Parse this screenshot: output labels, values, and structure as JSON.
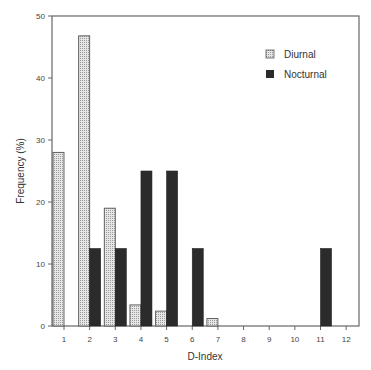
{
  "chart_data": {
    "type": "bar",
    "title": "",
    "xlabel": "D-Index",
    "ylabel": "Frequency (%)",
    "ylim": [
      0,
      50
    ],
    "yticks": [
      0,
      10,
      20,
      30,
      40,
      50
    ],
    "categories": [
      "1",
      "2",
      "3",
      "4",
      "5",
      "6",
      "7",
      "8",
      "9",
      "10",
      "11",
      "12"
    ],
    "series": [
      {
        "name": "Diurnal",
        "values": [
          28,
          46.8,
          19,
          3.4,
          2.4,
          0,
          1.2,
          0,
          0,
          0,
          0,
          0
        ],
        "color": "#d9d9d9",
        "pattern": "dotted"
      },
      {
        "name": "Nocturnal",
        "values": [
          0,
          12.5,
          12.5,
          25,
          25,
          12.5,
          0,
          0,
          0,
          0,
          12.5,
          0
        ],
        "color": "#2b2b2b",
        "pattern": "solid"
      }
    ],
    "grid": false,
    "legend_position": "upper right"
  },
  "legend": {
    "items": [
      {
        "label": "Diurnal"
      },
      {
        "label": "Nocturnal"
      }
    ]
  },
  "axes": {
    "x_label": "D-Index",
    "y_label": "Frequency (%)"
  }
}
